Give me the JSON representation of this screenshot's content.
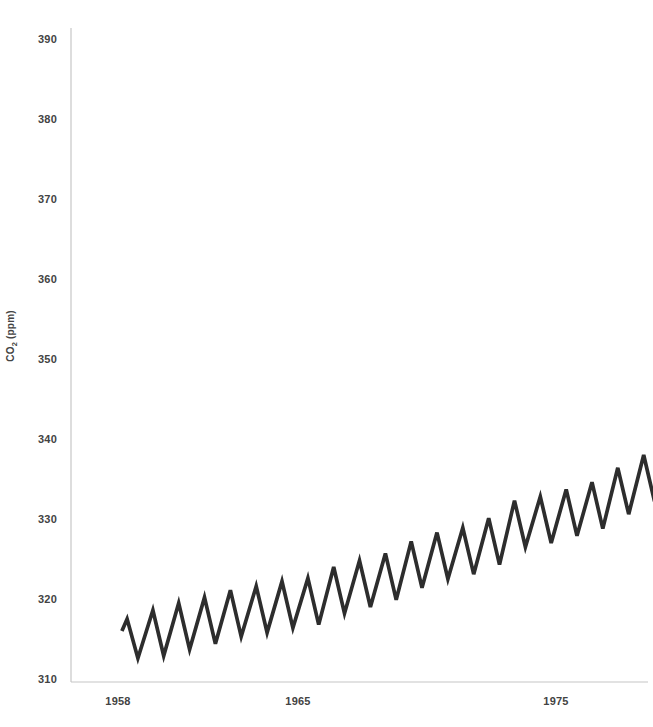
{
  "chart_data": {
    "type": "line",
    "title": "",
    "xlabel": "",
    "ylabel": "CO2 (ppm)",
    "ylabel_parts": {
      "main": "CO",
      "sub": "2",
      "unit": " (ppm)"
    },
    "y_ticks": [
      390,
      380,
      370,
      360,
      350,
      340,
      330,
      320,
      310
    ],
    "x_ticks": [
      1958,
      1965,
      1975
    ],
    "xlim": [
      1956.2,
      1978.8
    ],
    "ylim": [
      309.6,
      391.4
    ],
    "grid": false,
    "legend": "none",
    "colors": {
      "line": "#2d2d2d",
      "axis": "#c6c6c6",
      "labels": "#434343",
      "background": "#ffffff"
    },
    "series": [
      {
        "name": "Mauna Loa atmospheric CO2 (monthly, seasonal peaks and troughs)",
        "points": [
          [
            1958.17,
            316.0
          ],
          [
            1958.37,
            317.5
          ],
          [
            1958.79,
            312.6
          ],
          [
            1959.37,
            318.6
          ],
          [
            1959.79,
            312.9
          ],
          [
            1960.37,
            319.5
          ],
          [
            1960.79,
            313.7
          ],
          [
            1961.37,
            320.2
          ],
          [
            1961.79,
            314.4
          ],
          [
            1962.37,
            321.1
          ],
          [
            1962.79,
            315.3
          ],
          [
            1963.37,
            321.6
          ],
          [
            1963.79,
            315.8
          ],
          [
            1964.37,
            322.2
          ],
          [
            1964.79,
            316.4
          ],
          [
            1965.37,
            322.6
          ],
          [
            1965.79,
            316.8
          ],
          [
            1966.37,
            324.0
          ],
          [
            1966.79,
            318.2
          ],
          [
            1967.37,
            324.8
          ],
          [
            1967.79,
            319.0
          ],
          [
            1968.37,
            325.7
          ],
          [
            1968.79,
            319.9
          ],
          [
            1969.37,
            327.2
          ],
          [
            1969.79,
            321.4
          ],
          [
            1970.37,
            328.3
          ],
          [
            1970.79,
            322.5
          ],
          [
            1971.37,
            328.9
          ],
          [
            1971.79,
            323.1
          ],
          [
            1972.37,
            330.1
          ],
          [
            1972.79,
            324.3
          ],
          [
            1973.37,
            332.3
          ],
          [
            1973.79,
            326.5
          ],
          [
            1974.37,
            332.8
          ],
          [
            1974.79,
            327.0
          ],
          [
            1975.37,
            333.7
          ],
          [
            1975.79,
            327.9
          ],
          [
            1976.37,
            334.6
          ],
          [
            1976.79,
            328.8
          ],
          [
            1977.37,
            336.4
          ],
          [
            1977.79,
            330.6
          ],
          [
            1978.37,
            338.0
          ],
          [
            1978.79,
            332.2
          ]
        ]
      }
    ]
  }
}
